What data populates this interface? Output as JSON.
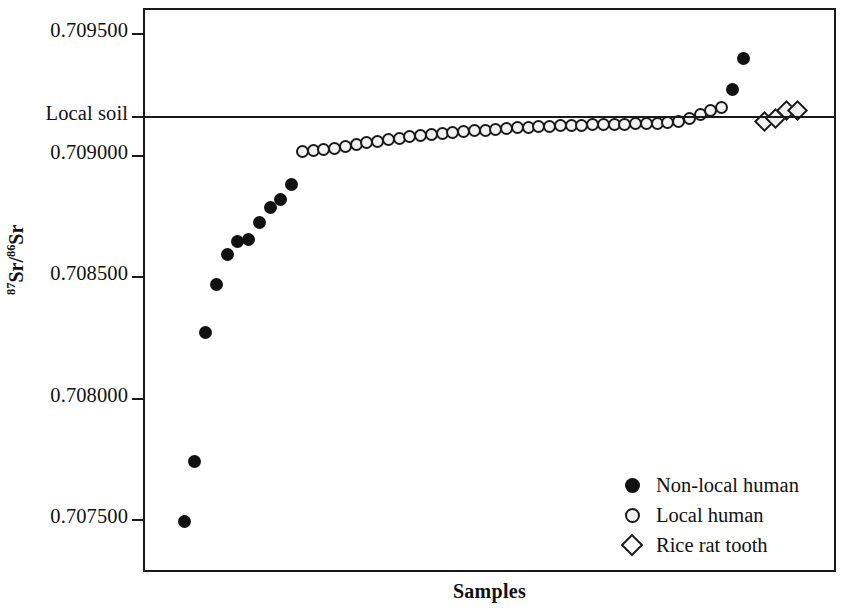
{
  "chart_data": {
    "type": "scatter",
    "title": "",
    "xlabel": "Samples",
    "ylabel": "87Sr/86Sr",
    "ylabel_sup_num": "87",
    "ylabel_mid": "Sr/",
    "ylabel_sup_den": "86",
    "ylabel_end": "Sr",
    "ylim": [
      0.7073,
      0.70962
    ],
    "yticks": [
      0.7095,
      0.709,
      0.7085,
      0.708,
      0.7075
    ],
    "ytick_labels": [
      "0.709500",
      "0.709000",
      "0.708500",
      "0.708000",
      "0.707500"
    ],
    "grid": false,
    "legend_position": "bottom-right",
    "reference_lines": [
      {
        "label": "Local soil",
        "value": 0.709159,
        "style": "solid",
        "color": "#1a1a1a"
      }
    ],
    "series": [
      {
        "name": "Non-local human",
        "marker": "filled-circle",
        "color": "#111111",
        "points": [
          {
            "x": 1,
            "y": 0.707499
          },
          {
            "x": 2,
            "y": 0.707744
          },
          {
            "x": 3,
            "y": 0.708276
          },
          {
            "x": 4,
            "y": 0.708475
          },
          {
            "x": 5,
            "y": 0.708595
          },
          {
            "x": 6,
            "y": 0.70865
          },
          {
            "x": 7,
            "y": 0.70866
          },
          {
            "x": 8,
            "y": 0.708727
          },
          {
            "x": 9,
            "y": 0.70879
          },
          {
            "x": 10,
            "y": 0.708822
          },
          {
            "x": 11,
            "y": 0.708884
          },
          {
            "x": 52,
            "y": 0.709274
          },
          {
            "x": 53,
            "y": 0.709404
          }
        ]
      },
      {
        "name": "Local human",
        "marker": "open-circle",
        "color": "#1a1a1a",
        "points": [
          {
            "x": 12,
            "y": 0.70902
          },
          {
            "x": 13,
            "y": 0.709024
          },
          {
            "x": 14,
            "y": 0.709028
          },
          {
            "x": 15,
            "y": 0.709033
          },
          {
            "x": 16,
            "y": 0.70904
          },
          {
            "x": 17,
            "y": 0.709048
          },
          {
            "x": 18,
            "y": 0.709056
          },
          {
            "x": 19,
            "y": 0.709063
          },
          {
            "x": 20,
            "y": 0.709069
          },
          {
            "x": 21,
            "y": 0.709075
          },
          {
            "x": 22,
            "y": 0.709081
          },
          {
            "x": 23,
            "y": 0.709086
          },
          {
            "x": 24,
            "y": 0.70909
          },
          {
            "x": 25,
            "y": 0.709094
          },
          {
            "x": 26,
            "y": 0.709098
          },
          {
            "x": 27,
            "y": 0.709102
          },
          {
            "x": 28,
            "y": 0.709106
          },
          {
            "x": 29,
            "y": 0.709109
          },
          {
            "x": 30,
            "y": 0.709112
          },
          {
            "x": 31,
            "y": 0.709115
          },
          {
            "x": 32,
            "y": 0.709118
          },
          {
            "x": 33,
            "y": 0.70912
          },
          {
            "x": 34,
            "y": 0.709122
          },
          {
            "x": 35,
            "y": 0.709124
          },
          {
            "x": 36,
            "y": 0.709126
          },
          {
            "x": 37,
            "y": 0.709128
          },
          {
            "x": 38,
            "y": 0.709129
          },
          {
            "x": 39,
            "y": 0.70913
          },
          {
            "x": 40,
            "y": 0.709131
          },
          {
            "x": 41,
            "y": 0.709132
          },
          {
            "x": 42,
            "y": 0.709133
          },
          {
            "x": 43,
            "y": 0.709134
          },
          {
            "x": 44,
            "y": 0.709135
          },
          {
            "x": 45,
            "y": 0.709137
          },
          {
            "x": 46,
            "y": 0.70914
          },
          {
            "x": 47,
            "y": 0.709146
          },
          {
            "x": 48,
            "y": 0.709155
          },
          {
            "x": 49,
            "y": 0.709171
          },
          {
            "x": 50,
            "y": 0.70919
          },
          {
            "x": 51,
            "y": 0.709203
          }
        ]
      },
      {
        "name": "Rice rat tooth",
        "marker": "open-diamond",
        "color": "#1a1a1a",
        "points": [
          {
            "x": 55,
            "y": 0.709145
          },
          {
            "x": 56,
            "y": 0.709156
          },
          {
            "x": 57,
            "y": 0.709188
          },
          {
            "x": 58,
            "y": 0.70919
          }
        ]
      }
    ]
  },
  "legend": {
    "items": [
      {
        "label": "Non-local human",
        "marker": "filled-circle"
      },
      {
        "label": "Local human",
        "marker": "open-circle"
      },
      {
        "label": "Rice rat tooth",
        "marker": "open-diamond"
      }
    ]
  }
}
